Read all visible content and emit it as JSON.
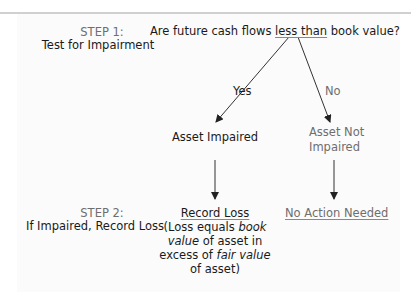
{
  "step1": {
    "label": "STEP 1:",
    "title": "Test for Impairment"
  },
  "question": {
    "prefix": "Are future cash flows ",
    "emphasis": "less than",
    "suffix": " book value?"
  },
  "branches": {
    "yes": "Yes",
    "no": "No"
  },
  "outcomes": {
    "impaired": "Asset Impaired",
    "not_impaired_line1": "Asset Not",
    "not_impaired_line2": "Impaired"
  },
  "step2": {
    "label": "STEP 2:",
    "title": "If Impaired, Record Loss"
  },
  "actions": {
    "record_loss": "Record Loss",
    "record_loss_note": {
      "l1a": "(Loss equals ",
      "l1b": "book",
      "l2a": "value",
      "l2b": " of asset in",
      "l3a": "excess of ",
      "l3b": "fair value",
      "l4": "of asset)"
    },
    "no_action": "No Action Needed"
  },
  "colors": {
    "text": "#1a1a1a",
    "muted": "#6e6e6e",
    "line": "#333333"
  }
}
